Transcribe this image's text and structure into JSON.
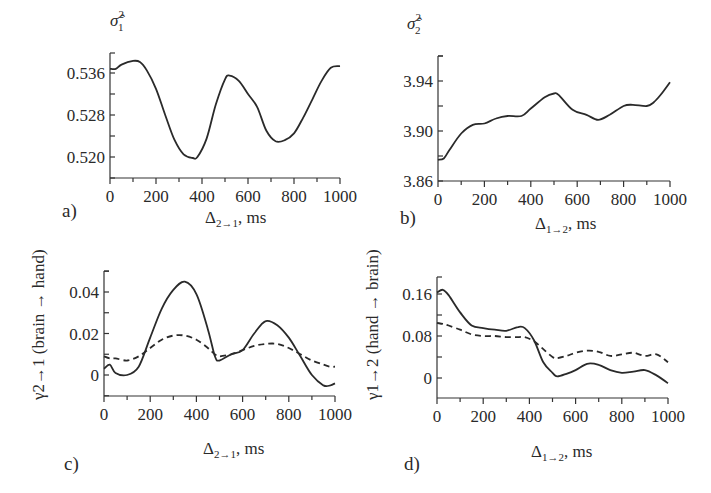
{
  "figure": {
    "panels": [
      {
        "letter": "a)",
        "ylabel_sym": "σ̂",
        "ylabel_sup": "2",
        "ylabel_sub": "1",
        "xlabel_main": "Δ",
        "xlabel_sub": "2→1",
        "xlabel_unit": ", ms"
      },
      {
        "letter": "b)",
        "ylabel_sym": "σ̂",
        "ylabel_sup": "2",
        "ylabel_sub": "2",
        "xlabel_main": "Δ",
        "xlabel_sub": "1→2",
        "xlabel_unit": ", ms"
      },
      {
        "letter": "c)",
        "ylabel": "γ2→1 (brain → hand)",
        "xlabel_main": "Δ",
        "xlabel_sub": "2→1",
        "xlabel_unit": ", ms"
      },
      {
        "letter": "d)",
        "ylabel": "γ1→2 (hand → brain)",
        "xlabel_main": "Δ",
        "xlabel_sub": "1→2",
        "xlabel_unit": ", ms"
      }
    ]
  },
  "chart_data": [
    {
      "type": "line",
      "panel": "a",
      "title": "",
      "xlabel": "Δ2→1, ms",
      "ylabel": "σ̂1²",
      "xlim": [
        0,
        1000
      ],
      "ylim": [
        0.515,
        0.541
      ],
      "xticks": [
        0,
        200,
        400,
        600,
        800,
        1000
      ],
      "yticks": [
        0.52,
        0.528,
        0.536
      ],
      "ytick_labels": [
        "0.520",
        "0.528",
        "0.536"
      ],
      "grid": false,
      "x": [
        0,
        25,
        50,
        100,
        130,
        160,
        200,
        240,
        280,
        320,
        360,
        380,
        420,
        460,
        500,
        520,
        560,
        600,
        640,
        680,
        720,
        760,
        800,
        840,
        880,
        920,
        960,
        1000
      ],
      "series": [
        {
          "name": "σ̂1²",
          "style": "solid",
          "values": [
            0.5368,
            0.5368,
            0.5376,
            0.5383,
            0.5381,
            0.5365,
            0.533,
            0.528,
            0.5233,
            0.5205,
            0.5198,
            0.52,
            0.5235,
            0.53,
            0.5348,
            0.5355,
            0.5345,
            0.532,
            0.5295,
            0.525,
            0.523,
            0.5232,
            0.5245,
            0.5275,
            0.531,
            0.5345,
            0.537,
            0.5373
          ]
        }
      ]
    },
    {
      "type": "line",
      "panel": "b",
      "title": "",
      "xlabel": "Δ1→2, ms",
      "ylabel": "σ̂2²",
      "xlim": [
        0,
        1000
      ],
      "ylim": [
        3.86,
        3.965
      ],
      "xticks": [
        0,
        200,
        400,
        600,
        800,
        1000
      ],
      "yticks": [
        3.86,
        3.9,
        3.94
      ],
      "ytick_labels": [
        "3.86",
        "3.90",
        "3.94"
      ],
      "grid": false,
      "x": [
        0,
        25,
        50,
        100,
        150,
        200,
        250,
        300,
        360,
        400,
        460,
        500,
        520,
        580,
        640,
        690,
        740,
        800,
        840,
        900,
        930,
        960,
        1000
      ],
      "series": [
        {
          "name": "σ̂2²",
          "style": "solid",
          "values": [
            3.877,
            3.878,
            3.885,
            3.898,
            3.905,
            3.906,
            3.91,
            3.912,
            3.912,
            3.918,
            3.927,
            3.93,
            3.929,
            3.917,
            3.913,
            3.909,
            3.913,
            3.92,
            3.921,
            3.92,
            3.923,
            3.929,
            3.939
          ]
        }
      ]
    },
    {
      "type": "line",
      "panel": "c",
      "title": "",
      "xlabel": "Δ2→1, ms",
      "ylabel": "γ2→1 (brain → hand)",
      "xlim": [
        0,
        1000
      ],
      "ylim": [
        -0.01,
        0.05
      ],
      "xticks": [
        0,
        200,
        400,
        600,
        800,
        1000
      ],
      "yticks": [
        0,
        0.02,
        0.04
      ],
      "ytick_labels": [
        "0",
        "0.02",
        "0.04"
      ],
      "grid": false,
      "x": [
        0,
        25,
        50,
        100,
        150,
        200,
        250,
        300,
        350,
        400,
        450,
        480,
        500,
        550,
        600,
        650,
        700,
        750,
        800,
        850,
        900,
        950,
        980,
        1000
      ],
      "series": [
        {
          "name": "solid",
          "style": "solid",
          "values": [
            0.003,
            0.005,
            0.001,
            0.0,
            0.004,
            0.018,
            0.032,
            0.041,
            0.045,
            0.039,
            0.022,
            0.009,
            0.007,
            0.01,
            0.012,
            0.02,
            0.026,
            0.024,
            0.018,
            0.009,
            0.0,
            -0.005,
            -0.005,
            -0.004
          ]
        },
        {
          "name": "dashed",
          "style": "dashed",
          "values": [
            0.009,
            0.008,
            0.008,
            0.007,
            0.009,
            0.013,
            0.017,
            0.019,
            0.019,
            0.017,
            0.013,
            0.01,
            0.009,
            0.01,
            0.012,
            0.014,
            0.015,
            0.015,
            0.013,
            0.01,
            0.007,
            0.005,
            0.004,
            0.004
          ]
        }
      ]
    },
    {
      "type": "line",
      "panel": "d",
      "title": "",
      "xlabel": "Δ1→2, ms",
      "ylabel": "γ1→2 (hand → brain)",
      "xlim": [
        0,
        1000
      ],
      "ylim": [
        -0.04,
        0.19
      ],
      "xticks": [
        0,
        200,
        400,
        600,
        800,
        1000
      ],
      "yticks": [
        0,
        0.08,
        0.16
      ],
      "ytick_labels": [
        "0",
        "0.08",
        "0.16"
      ],
      "grid": false,
      "x": [
        0,
        25,
        50,
        100,
        150,
        200,
        250,
        300,
        350,
        380,
        420,
        460,
        500,
        520,
        560,
        600,
        650,
        700,
        750,
        800,
        850,
        900,
        950,
        1000
      ],
      "series": [
        {
          "name": "solid",
          "style": "solid",
          "values": [
            0.163,
            0.168,
            0.158,
            0.125,
            0.1,
            0.095,
            0.092,
            0.09,
            0.097,
            0.095,
            0.072,
            0.03,
            0.01,
            0.003,
            0.008,
            0.015,
            0.027,
            0.025,
            0.015,
            0.01,
            0.012,
            0.015,
            0.005,
            -0.01
          ]
        },
        {
          "name": "dashed",
          "style": "dashed",
          "values": [
            0.105,
            0.103,
            0.1,
            0.092,
            0.083,
            0.08,
            0.08,
            0.078,
            0.078,
            0.078,
            0.07,
            0.055,
            0.04,
            0.038,
            0.042,
            0.048,
            0.052,
            0.05,
            0.042,
            0.045,
            0.048,
            0.042,
            0.045,
            0.03
          ]
        }
      ]
    }
  ]
}
